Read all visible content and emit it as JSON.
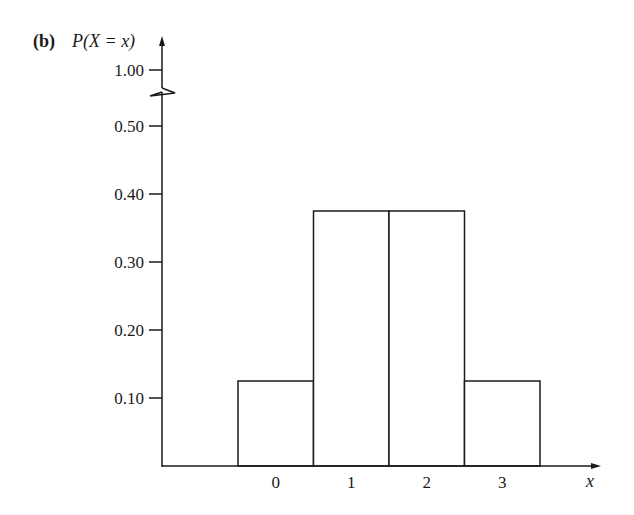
{
  "chart_data": {
    "type": "bar",
    "panel_label": "(b)",
    "title": "",
    "ylabel": "P(X = x)",
    "xlabel": "x",
    "categories": [
      "0",
      "1",
      "2",
      "3"
    ],
    "values": [
      0.125,
      0.375,
      0.375,
      0.125
    ],
    "yticks": [
      {
        "value": 0.1,
        "label": "0.10"
      },
      {
        "value": 0.2,
        "label": "0.20"
      },
      {
        "value": 0.3,
        "label": "0.30"
      },
      {
        "value": 0.4,
        "label": "0.40"
      },
      {
        "value": 0.5,
        "label": "0.50"
      },
      {
        "value": 1.0,
        "label": "1.00"
      }
    ],
    "axis_break": {
      "between": [
        0.5,
        1.0
      ]
    },
    "ylim": [
      0,
      1.0
    ],
    "grid": false,
    "legend": null,
    "bar_style": "histogram, adjacent bars, unit width, no fill"
  }
}
